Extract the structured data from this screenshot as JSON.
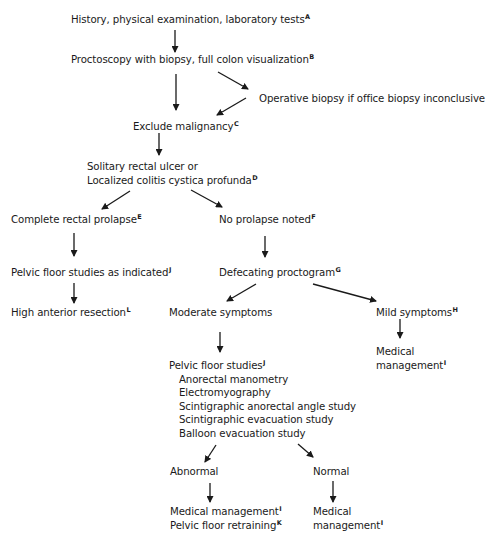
{
  "diagram": {
    "type": "flowchart",
    "nodes": {
      "history": {
        "label": "History, physical examination, laboratory tests",
        "note": "A"
      },
      "proctoscopy": {
        "label": "Proctoscopy with biopsy, full colon visualization",
        "note": "B"
      },
      "operative_biopsy": {
        "label": "Operative biopsy if office biopsy inconclusive"
      },
      "exclude_malignancy": {
        "label": "Exclude malignancy",
        "note": "C"
      },
      "solitary_ulcer": {
        "line1": "Solitary rectal ulcer or",
        "line2": "Localized colitis cystica profunda",
        "note": "D"
      },
      "complete_prolapse": {
        "label": "Complete rectal prolapse",
        "note": "E"
      },
      "no_prolapse": {
        "label": "No prolapse noted",
        "note": "F"
      },
      "pelvic_floor_indicated": {
        "label": "Pelvic floor studies as indicated",
        "note": "J"
      },
      "defecating_proctogram": {
        "label": "Defecating proctogram",
        "note": "G"
      },
      "high_anterior_resection": {
        "label": "High anterior resection",
        "note": "L"
      },
      "moderate_symptoms": {
        "label": "Moderate symptoms"
      },
      "mild_symptoms": {
        "label": "Mild symptoms",
        "note": "H"
      },
      "mild_medical": {
        "line1": "Medical",
        "line2": "management",
        "note": "I"
      },
      "pelvic_floor_studies": {
        "label": "Pelvic floor studies",
        "note": "J",
        "items": [
          "Anorectal manometry",
          "Electromyography",
          "Scintigraphic anorectal angle study",
          "Scintigraphic evacuation study",
          "Balloon evacuation study"
        ]
      },
      "abnormal": {
        "label": "Abnormal"
      },
      "normal": {
        "label": "Normal"
      },
      "abnormal_outcome": {
        "line1": "Medical management",
        "note1": "I",
        "line2": "Pelvic floor retraining",
        "note2": "K"
      },
      "normal_outcome": {
        "line1": "Medical",
        "line2": "management",
        "note": "I"
      }
    },
    "edges": [
      [
        "history",
        "proctoscopy"
      ],
      [
        "proctoscopy",
        "exclude_malignancy"
      ],
      [
        "proctoscopy",
        "operative_biopsy"
      ],
      [
        "operative_biopsy",
        "exclude_malignancy"
      ],
      [
        "exclude_malignancy",
        "solitary_ulcer"
      ],
      [
        "solitary_ulcer",
        "complete_prolapse"
      ],
      [
        "solitary_ulcer",
        "no_prolapse"
      ],
      [
        "complete_prolapse",
        "pelvic_floor_indicated"
      ],
      [
        "pelvic_floor_indicated",
        "high_anterior_resection"
      ],
      [
        "no_prolapse",
        "defecating_proctogram"
      ],
      [
        "defecating_proctogram",
        "moderate_symptoms"
      ],
      [
        "defecating_proctogram",
        "mild_symptoms"
      ],
      [
        "mild_symptoms",
        "mild_medical"
      ],
      [
        "moderate_symptoms",
        "pelvic_floor_studies"
      ],
      [
        "pelvic_floor_studies",
        "abnormal"
      ],
      [
        "pelvic_floor_studies",
        "normal"
      ],
      [
        "abnormal",
        "abnormal_outcome"
      ],
      [
        "normal",
        "normal_outcome"
      ]
    ]
  }
}
